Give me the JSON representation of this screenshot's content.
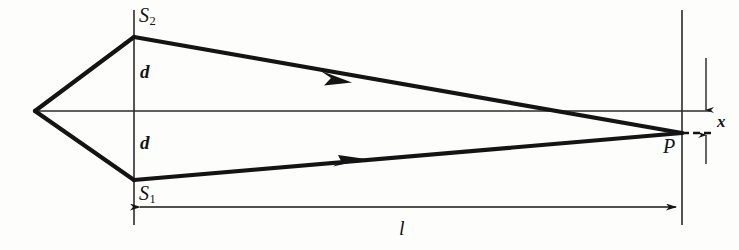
{
  "figure": {
    "kind": "optics-ray-diagram",
    "labels": {
      "slit_upper": "S",
      "slit_upper_sub": "2",
      "slit_lower": "S",
      "slit_lower_sub": "1",
      "half_separation_upper": "d",
      "half_separation_lower": "d",
      "screen_point": "P",
      "screen_distance": "l",
      "transverse_offset": "x"
    },
    "colors": {
      "ink": "#141414",
      "thin_ink": "#2a2a2a",
      "background": "#fdfdfc"
    },
    "geometry": {
      "source_vertex": [
        35,
        111
      ],
      "slit_plane_x": 134,
      "slit_plane_y_range": [
        10,
        225
      ],
      "slit_upper_point": [
        134,
        37
      ],
      "slit_lower_point": [
        134,
        180
      ],
      "axis_y": 111,
      "axis_x_range": [
        35,
        710
      ],
      "screen_plane_x": 682,
      "screen_plane_y_range": [
        10,
        225
      ],
      "point_p": [
        682,
        133
      ],
      "dashed_x_range": [
        682,
        712
      ],
      "length_arrow_y": 207,
      "length_arrow_x_range": [
        134,
        682
      ],
      "offset_arrow_x": 706,
      "ray_arrow_upper": [
        337,
        78
      ],
      "ray_arrow_lower": [
        350,
        165
      ]
    }
  }
}
